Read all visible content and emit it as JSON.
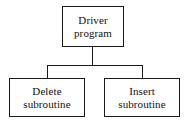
{
  "diagram": {
    "type": "tree",
    "line_color": "#1a1a1a",
    "box_fill": "#ffffff",
    "background": "#ffffff",
    "nodes": [
      {
        "id": "root",
        "line1": "Driver",
        "line2": "program"
      },
      {
        "id": "delete",
        "line1": "Delete",
        "line2": "subroutine"
      },
      {
        "id": "insert",
        "line1": "Insert",
        "line2": "subroutine"
      }
    ],
    "connectors": [
      {
        "id": "root-stem",
        "from": "root",
        "to": "bus"
      },
      {
        "id": "bus",
        "from": "root",
        "to": "children"
      },
      {
        "id": "left-drop",
        "from": "bus",
        "to": "delete"
      },
      {
        "id": "right-drop",
        "from": "bus",
        "to": "insert"
      }
    ]
  }
}
